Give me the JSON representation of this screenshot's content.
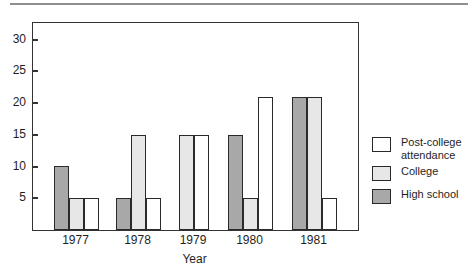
{
  "chart_data": {
    "type": "bar",
    "title": "",
    "xlabel": "Year",
    "ylabel": "",
    "categories": [
      "1977",
      "1978",
      "1979",
      "1980",
      "1981"
    ],
    "series": [
      {
        "name": "High school",
        "color": "#a8a8a8",
        "values": [
          10,
          5,
          null,
          15,
          21
        ]
      },
      {
        "name": "College",
        "color": "#e7e7e7",
        "values": [
          5,
          15,
          15,
          5,
          21
        ]
      },
      {
        "name": "Post-college attendance",
        "color": "#ffffff",
        "values": [
          5,
          5,
          15,
          21,
          5
        ]
      }
    ],
    "yticks": [
      5,
      10,
      15,
      20,
      25,
      30
    ],
    "ylim": [
      0,
      32.6
    ],
    "grid": false,
    "bar_outline": "#2a2a2a",
    "legend": {
      "position": "right",
      "entries": [
        {
          "label": "Post-college attendance",
          "label_lines": [
            "Post-college",
            "attendance"
          ],
          "color": "#ffffff"
        },
        {
          "label": "College",
          "label_lines": [
            "College"
          ],
          "color": "#e7e7e7"
        },
        {
          "label": "High school",
          "label_lines": [
            "High school"
          ],
          "color": "#a8a8a8"
        }
      ]
    }
  }
}
